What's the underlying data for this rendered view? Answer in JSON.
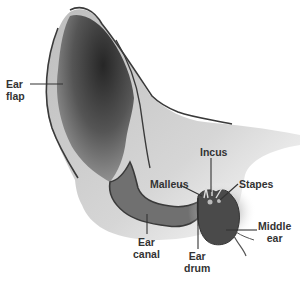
{
  "diagram": {
    "labels": {
      "ear_flap": {
        "line1": "Ear",
        "line2": "flap"
      },
      "incus": "Incus",
      "malleus": "Malleus",
      "stapes": "Stapes",
      "middle_ear": {
        "line1": "Middle",
        "line2": "ear"
      },
      "ear_canal": {
        "line1": "Ear",
        "line2": "canal"
      },
      "ear_drum": {
        "line1": "Ear",
        "line2": "drum"
      }
    },
    "colors": {
      "outline": "#3a3a3a",
      "flap_dark": "#2e2e2e",
      "flap_mid": "#7a7a7a",
      "skin_light": "#c8c8c8",
      "canal_fill": "#707070",
      "middle_ear_fill": "#4a4a4a",
      "label_text": "#333333"
    }
  }
}
